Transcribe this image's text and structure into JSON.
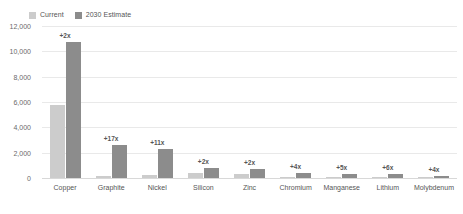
{
  "legend": {
    "position": "top-left",
    "items": [
      {
        "label": "Current",
        "color": "#cccccc",
        "swatch_name": "legend-swatch-current"
      },
      {
        "label": "2030 Estimate",
        "color": "#8c8c8c",
        "swatch_name": "legend-swatch-estimate"
      }
    ]
  },
  "yaxis": {
    "ticks": [
      "0",
      "2,000",
      "4,000",
      "6,000",
      "8,000",
      "10,000",
      "12,000"
    ]
  },
  "chart_data": {
    "type": "bar",
    "title": "",
    "subtitle": "",
    "xlabel": "",
    "ylabel": "",
    "ylim": [
      0,
      12000
    ],
    "ytick_values": [
      0,
      2000,
      4000,
      6000,
      8000,
      10000,
      12000
    ],
    "grid": true,
    "legend_position": "top-left",
    "categories": [
      "Copper",
      "Graphite",
      "Nickel",
      "Silicon",
      "Zinc",
      "Chromium",
      "Manganese",
      "Lithium",
      "Molybdenum"
    ],
    "series": [
      {
        "name": "Current",
        "color": "#cccccc",
        "values": [
          5800,
          150,
          200,
          380,
          350,
          90,
          70,
          50,
          40
        ]
      },
      {
        "name": "2030 Estimate",
        "color": "#8c8c8c",
        "values": [
          10700,
          2600,
          2300,
          760,
          700,
          360,
          350,
          300,
          160
        ]
      }
    ],
    "annotations": [
      "+2x",
      "+17x",
      "+11x",
      "+2x",
      "+2x",
      "+4x",
      "+5x",
      "+6x",
      "+4x"
    ]
  }
}
